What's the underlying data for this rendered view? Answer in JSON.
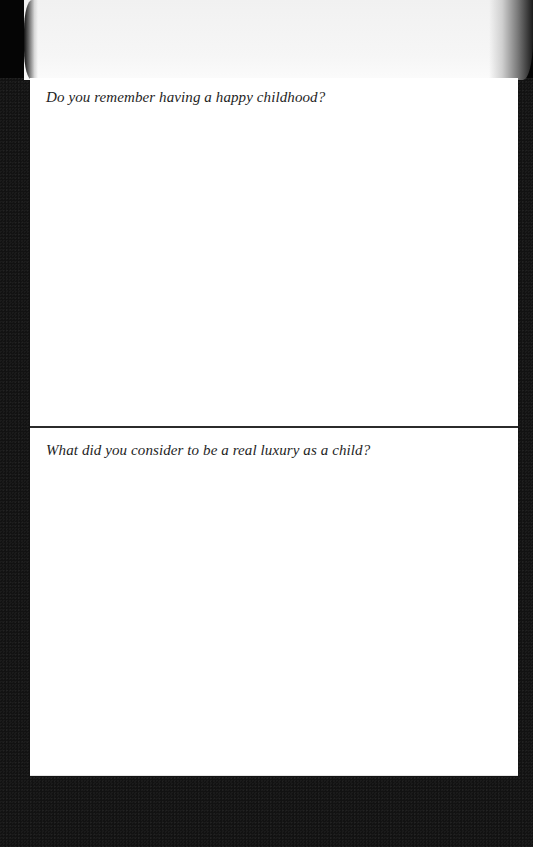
{
  "page": {
    "background_color": "#ffffff",
    "surround_color": "#121212",
    "divider_color": "#2b2b2b",
    "text_color": "#1e1e1e"
  },
  "sections": [
    {
      "prompt": "Do you remember having a happy childhood?",
      "answer": ""
    },
    {
      "prompt": "What did you consider to be a real luxury as a child?",
      "answer": ""
    }
  ]
}
